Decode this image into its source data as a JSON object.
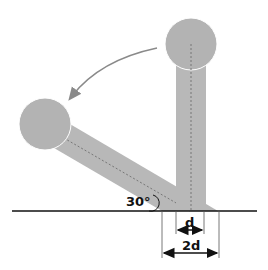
{
  "diagram": {
    "labels": {
      "angle": "30°",
      "dim_small": "d",
      "dim_large": "2d"
    },
    "colors": {
      "rod": "#b8b8b8",
      "ball": "#b3b3b3",
      "line": "#111111",
      "arrow": "#8a8a8a",
      "dashed": "#777777",
      "background": "#ffffff"
    },
    "angle_degrees": 30
  }
}
